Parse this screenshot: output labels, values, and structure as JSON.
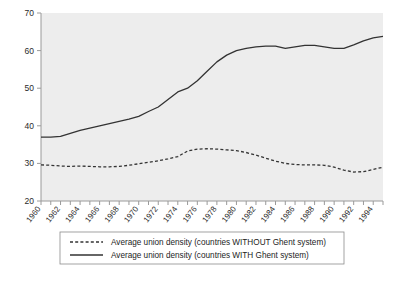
{
  "chart_data": {
    "type": "line",
    "title": "",
    "subtitle": "",
    "xlabel": "",
    "ylabel": "",
    "xlim": [
      1960,
      1995
    ],
    "ylim": [
      20,
      70
    ],
    "yticks": [
      20,
      30,
      40,
      50,
      60,
      70
    ],
    "ytick_labels": [
      "20",
      "30",
      "40",
      "50",
      "60",
      "70"
    ],
    "grid": false,
    "legend_position": "below-axes",
    "plot_bgcolor": "#ededed",
    "line_color": "#333333",
    "x": [
      1960,
      1961,
      1962,
      1963,
      1964,
      1965,
      1966,
      1967,
      1968,
      1969,
      1970,
      1971,
      1972,
      1973,
      1974,
      1975,
      1976,
      1977,
      1978,
      1979,
      1980,
      1981,
      1982,
      1983,
      1984,
      1985,
      1986,
      1987,
      1988,
      1989,
      1990,
      1991,
      1992,
      1993,
      1994,
      1995
    ],
    "xtick_labels": [
      "1960",
      "1962",
      "1964",
      "1966",
      "1968",
      "1970",
      "1972",
      "1974",
      "1976",
      "1978",
      "1980",
      "1982",
      "1984",
      "1986",
      "1988",
      "1990",
      "1992",
      "1994"
    ],
    "series": [
      {
        "name": "Average union density (countries WITHOUT Ghent system)",
        "style": "dashed",
        "values": [
          29.6,
          29.5,
          29.3,
          29.2,
          29.3,
          29.2,
          29.1,
          29.1,
          29.2,
          29.5,
          29.9,
          30.3,
          30.7,
          31.2,
          31.8,
          33.3,
          33.8,
          33.9,
          33.8,
          33.6,
          33.4,
          32.9,
          32.2,
          31.4,
          30.6,
          30.0,
          29.7,
          29.6,
          29.6,
          29.5,
          29.0,
          28.2,
          27.7,
          27.8,
          28.4,
          29.0
        ]
      },
      {
        "name": "Average union density (countries WITH Ghent system)",
        "style": "solid",
        "values": [
          37.0,
          37.0,
          37.2,
          38.0,
          38.8,
          39.4,
          40.0,
          40.6,
          41.2,
          41.8,
          42.5,
          43.8,
          45.0,
          47.0,
          49.0,
          50.0,
          52.0,
          54.5,
          57.0,
          58.8,
          60.0,
          60.6,
          61.0,
          61.2,
          61.2,
          60.6,
          61.0,
          61.4,
          61.4,
          61.0,
          60.6,
          60.6,
          61.5,
          62.6,
          63.4,
          63.8
        ]
      }
    ]
  },
  "legend": {
    "entries": [
      {
        "label": "Average union density (countries WITHOUT Ghent system)",
        "style": "dashed"
      },
      {
        "label": "Average union density (countries WITH Ghent system)",
        "style": "solid"
      }
    ]
  }
}
